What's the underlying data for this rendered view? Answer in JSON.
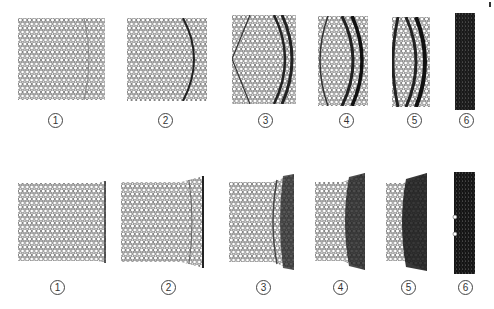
{
  "figure": {
    "rows": [
      {
        "id": "top-row",
        "stages": [
          {
            "label": "1",
            "box": [
              18,
              18,
              87,
              82
            ],
            "band": "light-curve",
            "density": 0.05
          },
          {
            "label": "2",
            "box": [
              127,
              18,
              80,
              83
            ],
            "band": "single-curve",
            "density": 0.12
          },
          {
            "label": "3",
            "box": [
              232,
              15,
              64,
              89
            ],
            "band": "double-curve",
            "density": 0.35
          },
          {
            "label": "4",
            "box": [
              318,
              16,
              50,
              90
            ],
            "band": "lens",
            "density": 0.5
          },
          {
            "label": "5",
            "box": [
              392,
              17,
              38,
              90
            ],
            "band": "lens-dense",
            "density": 0.65
          },
          {
            "label": "6",
            "box": [
              455,
              13,
              20,
              97
            ],
            "band": "full",
            "density": 0.95
          }
        ],
        "label_y": 113,
        "label_x": [
          48,
          158,
          258,
          339,
          407,
          459
        ]
      },
      {
        "id": "bottom-row",
        "stages": [
          {
            "label": "1",
            "box": [
              18,
              181,
              88,
              82
            ],
            "band": "edge-thin",
            "density": 0.05
          },
          {
            "label": "2",
            "box": [
              121,
              176,
              83,
              92
            ],
            "band": "edge-flare",
            "density": 0.12
          },
          {
            "label": "3",
            "box": [
              229,
              174,
              65,
              96
            ],
            "band": "edge-dense",
            "density": 0.35
          },
          {
            "label": "4",
            "box": [
              315,
              173,
              50,
              97
            ],
            "band": "edge-wider",
            "density": 0.5
          },
          {
            "label": "5",
            "box": [
              386,
              173,
              41,
              98
            ],
            "band": "edge-wide",
            "density": 0.65
          },
          {
            "label": "6",
            "box": [
              452,
              172,
              23,
              102
            ],
            "band": "full",
            "density": 0.95
          }
        ],
        "label_y": 280,
        "label_x": [
          50,
          161,
          256,
          333,
          401,
          458
        ]
      }
    ],
    "colors": {
      "line": "#555555",
      "dense": "#1a1a1a",
      "background": "#ffffff"
    }
  }
}
